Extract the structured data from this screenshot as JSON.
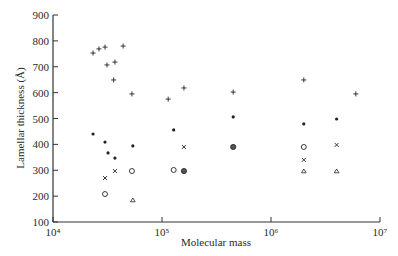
{
  "chart_data": {
    "type": "scatter",
    "title": "",
    "xlabel": "Molecular mass",
    "ylabel": "Lamellar thickness (Å)",
    "xscale": "log",
    "xlim": [
      10000,
      10000000
    ],
    "ylim": [
      100,
      900
    ],
    "x_ticks": [
      {
        "value": 10000,
        "label": "10⁴"
      },
      {
        "value": 100000,
        "label": "10⁵"
      },
      {
        "value": 1000000,
        "label": "10⁶"
      },
      {
        "value": 10000000,
        "label": "10⁷"
      }
    ],
    "y_ticks": [
      100,
      200,
      300,
      400,
      500,
      600,
      700,
      800,
      900
    ],
    "grid": false,
    "legend": null,
    "series": [
      {
        "name": "plus",
        "marker": "+",
        "points": [
          [
            23300,
            753
          ],
          [
            26400,
            769
          ],
          [
            30000,
            776
          ],
          [
            44000,
            780
          ],
          [
            31300,
            707
          ],
          [
            37000,
            718
          ],
          [
            36000,
            649
          ],
          [
            53000,
            595
          ],
          [
            114000,
            575
          ],
          [
            159000,
            618
          ],
          [
            450000,
            602
          ],
          [
            2000000,
            649
          ],
          [
            6000000,
            595
          ]
        ]
      },
      {
        "name": "dot",
        "marker": "•",
        "points": [
          [
            23300,
            440
          ],
          [
            30000,
            409
          ],
          [
            32000,
            367
          ],
          [
            37000,
            347
          ],
          [
            54000,
            394
          ],
          [
            128000,
            456
          ],
          [
            450000,
            506
          ],
          [
            2000000,
            479
          ],
          [
            4000000,
            498
          ]
        ]
      },
      {
        "name": "cross",
        "marker": "x",
        "points": [
          [
            30000,
            270
          ],
          [
            37000,
            297
          ],
          [
            159000,
            390
          ],
          [
            2000000,
            340
          ],
          [
            4000000,
            398
          ]
        ]
      },
      {
        "name": "open-circle",
        "marker": "o",
        "points": [
          [
            30000,
            208
          ],
          [
            53000,
            297
          ],
          [
            128000,
            301
          ],
          [
            2000000,
            390
          ]
        ]
      },
      {
        "name": "filled-circle",
        "marker": "●",
        "points": [
          [
            159000,
            297
          ],
          [
            450000,
            390
          ]
        ]
      },
      {
        "name": "triangle",
        "marker": "△",
        "points": [
          [
            54000,
            185
          ],
          [
            2000000,
            297
          ],
          [
            4000000,
            297
          ]
        ]
      }
    ]
  }
}
